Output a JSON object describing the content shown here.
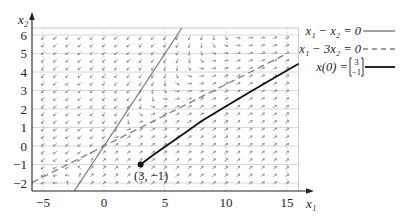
{
  "chart_data": {
    "type": "line",
    "title": "",
    "xlabel": "x₁",
    "ylabel": "x₂",
    "xlim": [
      -5.9,
      15.95
    ],
    "ylim": [
      -2.43,
      6.38
    ],
    "xticks": [
      -5,
      0,
      5,
      10,
      15
    ],
    "xtick_labels": [
      "−5",
      "0",
      "5",
      "10",
      "15"
    ],
    "yticks": [
      -2,
      -1,
      0,
      1,
      2,
      3,
      4,
      5,
      6
    ],
    "ytick_labels": [
      "−2",
      "−1",
      "0",
      "1",
      "2",
      "3",
      "4",
      "5",
      "6"
    ],
    "grid": true,
    "legend_position": "right",
    "series": [
      {
        "name": "x₁ − x₂ = 0",
        "style": "solid",
        "color": "#7a7a7a",
        "x": [
          -2.43,
          6.38
        ],
        "y": [
          -2.43,
          6.38
        ]
      },
      {
        "name": "x₁ − 3x₂ = 0",
        "style": "dashed",
        "color": "#808080",
        "x": [
          -5.9,
          14.7
        ],
        "y": [
          -1.97,
          4.9
        ]
      },
      {
        "name": "x(0) = [3, −1]",
        "style": "solid",
        "color": "#111111",
        "x": [
          3,
          4,
          5,
          6,
          7,
          8,
          10,
          12,
          14,
          15.95
        ],
        "y": [
          -1,
          -0.5,
          -0.04,
          0.42,
          0.88,
          1.35,
          2.15,
          2.93,
          3.71,
          4.45
        ]
      }
    ],
    "annotations": [
      {
        "text": "(3, −1)",
        "x": 3,
        "y": -1,
        "marker": "filled-circle"
      }
    ],
    "vector_field": {
      "matrix": [
        [
          2,
          -3
        ],
        [
          1,
          -2
        ]
      ],
      "x_start": -5,
      "x_end": 15,
      "x_count": 21,
      "y_start": -2,
      "y_end": 5.85,
      "y_count": 20,
      "color": "#666666"
    }
  },
  "legend": {
    "line1": "x₁ − x₂ = 0",
    "line2": "x₁ − 3x₂ = 0",
    "line3_prefix": "x(0) = ",
    "line3_vector_top": "3",
    "line3_vector_bottom": "−1"
  },
  "plot_box": {
    "left": 32,
    "right": 298.6,
    "top": 28,
    "bottom": 191
  }
}
